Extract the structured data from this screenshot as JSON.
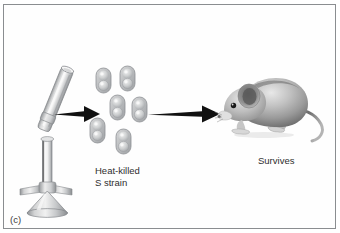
{
  "figure": {
    "panel_label": "(c)",
    "domain_note": "textbook illustration panel",
    "border_color": "#8a8d90",
    "background_color": "#fefefe"
  },
  "labels": {
    "heat_killed": "Heat-killed\nS strain",
    "survives": "Survives"
  },
  "stages": [
    {
      "name": "bunsen-burner",
      "icon": "bunsen-burner-icon"
    },
    {
      "name": "arrow-one",
      "icon": "arrow-right-icon"
    },
    {
      "name": "heat-killed-s-strain-bacteria",
      "icon": "bacteria-cluster-icon",
      "cell_count": 6
    },
    {
      "name": "arrow-two",
      "icon": "arrow-right-icon"
    },
    {
      "name": "mouse",
      "icon": "mouse-icon",
      "outcome": "Survives"
    }
  ],
  "colors": {
    "arrow": "#111111",
    "text": "#2e2e2e",
    "cell_body": "#b7b9bb",
    "cell_outline": "#8e9194",
    "cell_highlight": "#dedfe0",
    "metal_light": "#eceded",
    "metal_mid": "#c2c4c6",
    "metal_dark": "#8f9295",
    "mouse_light": "#dddddd",
    "mouse_mid": "#a9a9a9",
    "mouse_dark": "#5f5f5f"
  }
}
